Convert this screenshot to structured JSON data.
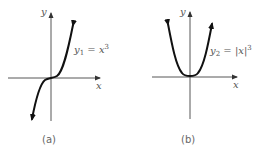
{
  "figure": {
    "panels": [
      {
        "id": "a",
        "caption": "(a)",
        "x_axis_label": "x",
        "y_axis_label": "y",
        "equation": {
          "lhs": "y",
          "sub": "1",
          "eq": " = ",
          "rhs": "x",
          "sup": "3"
        },
        "curve": "cubic"
      },
      {
        "id": "b",
        "caption": "(b)",
        "x_axis_label": "x",
        "y_axis_label": "y",
        "equation": {
          "lhs": "y",
          "sub": "2",
          "eq": " = ",
          "rhs": "|x|",
          "sup": "3"
        },
        "curve": "abs-cubic"
      }
    ],
    "colors": {
      "axis": "#444444",
      "curve": "#111111",
      "text": "#555555"
    }
  }
}
